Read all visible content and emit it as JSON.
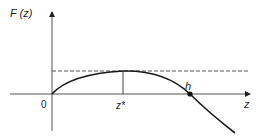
{
  "diagram": {
    "y_axis_label": "F (z)",
    "x_axis_label": "z",
    "origin_label": "0",
    "peak_label": "z*",
    "root_label": "h",
    "colors": {
      "axis": "#444444",
      "curve": "#1a1a1a",
      "dashed": "#555555",
      "text": "#222222"
    }
  }
}
